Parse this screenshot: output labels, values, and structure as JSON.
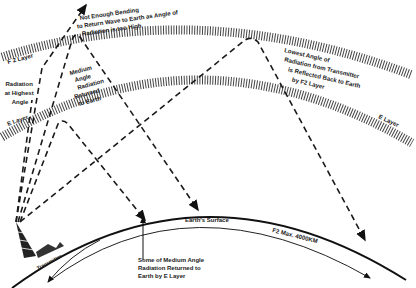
{
  "diagram": {
    "layers": {
      "f2_label": "F 2 Layer",
      "e_label_left": "E Layer",
      "e_label_right": "E Layer"
    },
    "annotations": {
      "escape": [
        "Not Enough Bending",
        "to Return Wave to Earth as Angle of",
        "Radiation is too High"
      ],
      "highest": [
        "Radiation",
        "at Highest",
        "Angle"
      ],
      "medium": [
        "Medium",
        "Angle",
        "Radiation",
        "Returned",
        "to Earth"
      ],
      "lowest": [
        "Lowest Angle of",
        "Radiation from Transmitter",
        "is Reflected Back to Earth",
        "by F2 Layer"
      ],
      "e_return": [
        "Some of Medium Angle",
        "Radiation Returned to",
        "Earth by E Layer"
      ],
      "surface": "Earth's Surface",
      "range": "F2 Max. 4000KM",
      "transmitter": "Transmitter"
    }
  }
}
